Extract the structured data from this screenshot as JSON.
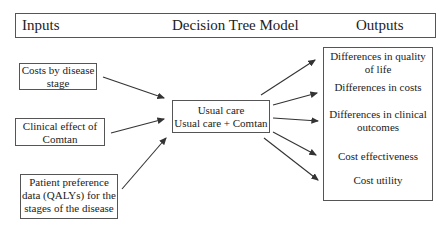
{
  "header": {
    "left": "Inputs",
    "center": "Decision Tree  Model",
    "right": "Outputs"
  },
  "inputs": [
    {
      "line1": "Costs by disease",
      "line2": "stage"
    },
    {
      "line1": "Clinical effect of",
      "line2": "Comtan"
    },
    {
      "line1": "Patient preference",
      "line2": "data (QALYs) for the",
      "line3": "stages of the disease"
    }
  ],
  "model": {
    "line1": "Usual care",
    "line2": "Usual care + Comtan"
  },
  "outputs": [
    {
      "line1": "Differences in quality",
      "line2": "of life"
    },
    {
      "line1": "Differences in costs"
    },
    {
      "line1": "Differences in clinical",
      "line2": "outcomes"
    },
    {
      "line1": "Cost effectiveness"
    },
    {
      "line1": "Cost utility"
    }
  ]
}
